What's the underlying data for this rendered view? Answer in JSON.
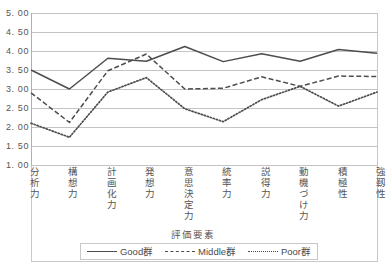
{
  "chart_data": {
    "type": "line",
    "title": "",
    "xlabel": "評価要素",
    "ylabel": "",
    "ylim": [
      1.0,
      5.0
    ],
    "ytick_labels": [
      "5. 00",
      "4. 50",
      "4. 00",
      "3. 50",
      "3. 00",
      "2. 50",
      "2. 00",
      "1. 50",
      "1. 00"
    ],
    "ytick_values": [
      5.0,
      4.5,
      4.0,
      3.5,
      3.0,
      2.5,
      2.0,
      1.5,
      1.0
    ],
    "grid": true,
    "legend_position": "bottom",
    "categories": [
      "分析力",
      "構想力",
      "計画化力",
      "発想力",
      "意思決定力",
      "統率力",
      "説得力",
      "動機づけ力",
      "積極性",
      "強靱性"
    ],
    "series": [
      {
        "name": "Good群",
        "style": "solid",
        "color": "#4d4d4d",
        "values": [
          3.5,
          3.0,
          3.81,
          3.73,
          4.12,
          3.72,
          3.93,
          3.73,
          4.04,
          3.94
        ]
      },
      {
        "name": "Middle群",
        "style": "dashed",
        "color": "#4d4d4d",
        "values": [
          2.9,
          2.12,
          3.48,
          3.92,
          3.0,
          3.02,
          3.32,
          3.07,
          3.34,
          3.33
        ]
      },
      {
        "name": "Poor群",
        "style": "dotted",
        "color": "#4d4d4d",
        "values": [
          2.1,
          1.73,
          2.92,
          3.3,
          2.48,
          2.14,
          2.72,
          3.07,
          2.55,
          2.92
        ]
      }
    ]
  },
  "legend": {
    "entries": [
      {
        "label": "Good群"
      },
      {
        "label": "Middle群"
      },
      {
        "label": "Poor群"
      }
    ]
  }
}
